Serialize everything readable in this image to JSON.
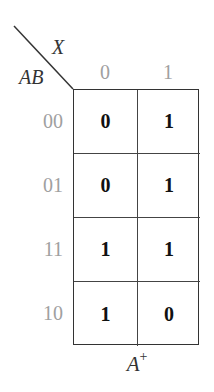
{
  "kmap": {
    "column_variable": "X",
    "row_variable": "AB",
    "column_labels": [
      "0",
      "1"
    ],
    "row_labels": [
      "00",
      "01",
      "11",
      "10"
    ],
    "cells": [
      [
        "0",
        "1"
      ],
      [
        "0",
        "1"
      ],
      [
        "1",
        "1"
      ],
      [
        "1",
        "0"
      ]
    ],
    "title_base": "A",
    "title_sup": "+",
    "colors": {
      "header_gray": "#a0a0a0",
      "line": "#333333",
      "text": "#111111"
    }
  }
}
